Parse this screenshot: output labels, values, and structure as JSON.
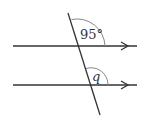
{
  "diagram": {
    "type": "parallel-lines-transversal",
    "colors": {
      "line": "#333333",
      "arc": "#888888",
      "background": "#ffffff"
    },
    "angles": {
      "top": {
        "label": "95°",
        "value": 95
      },
      "bottom": {
        "label": "q",
        "value": null
      }
    }
  }
}
